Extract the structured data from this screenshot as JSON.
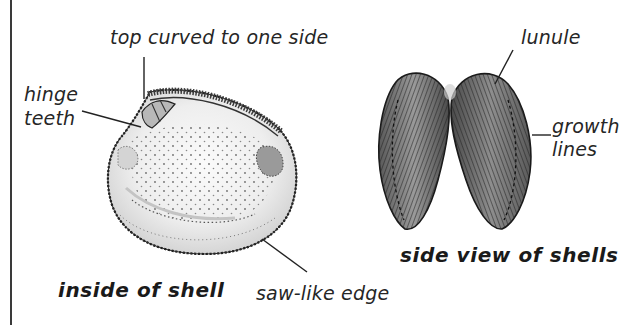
{
  "figure": {
    "left_panel": {
      "caption": "inside of shell",
      "labels": {
        "top": "top curved to one side",
        "hinge_line1": "hinge",
        "hinge_line2": "teeth",
        "edge": "saw-like edge"
      }
    },
    "right_panel": {
      "caption": "side view of shells",
      "labels": {
        "lunule": "lunule",
        "growth_line1": "growth",
        "growth_line2": "lines"
      }
    },
    "colors": {
      "ink": "#1e1e1e",
      "shell_inner_fill": "#e9e9e9",
      "shell_side_fill": "#7a7a7a",
      "border": "#3a3a3a"
    }
  }
}
